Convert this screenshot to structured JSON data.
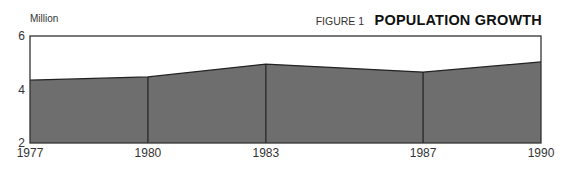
{
  "header": {
    "unit_label": "Million",
    "figure_label": "FIGURE 1",
    "figure_title": "POPULATION GROWTH"
  },
  "colors": {
    "fill": "#6e6e6e",
    "line": "#222222",
    "frame": "#333333",
    "background": "#ffffff"
  },
  "chart_data": {
    "type": "area",
    "title": "POPULATION GROWTH",
    "subtitle": "FIGURE 1",
    "xlabel": "",
    "ylabel": "Million",
    "categories": [
      "1977",
      "1980",
      "1983",
      "1987",
      "1990"
    ],
    "x": [
      1977,
      1980,
      1983,
      1987,
      1990
    ],
    "values": [
      4.35,
      4.47,
      4.95,
      4.65,
      5.03
    ],
    "series": [
      {
        "name": "Population (Million)",
        "values": [
          4.35,
          4.47,
          4.95,
          4.65,
          5.03
        ]
      }
    ],
    "ylim": [
      2,
      6
    ],
    "yticks": [
      "2",
      "4",
      "6"
    ],
    "xticks": [
      "1977",
      "1980",
      "1983",
      "1987",
      "1990"
    ],
    "grid": false,
    "legend": "none",
    "vertical_dividers_at": [
      "1980",
      "1983",
      "1987"
    ]
  }
}
